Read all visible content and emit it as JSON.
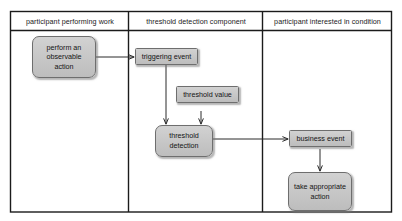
{
  "diagram": {
    "colors": {
      "node_fill": "#c6c6c6",
      "node_border": "#6e6e6e",
      "frame_line": "#1b1b1b",
      "connector": "#2b2b2b",
      "background": "#ffffff"
    },
    "lanes": [
      {
        "id": "lane-participant-performing-work",
        "label": "participant performing work"
      },
      {
        "id": "lane-threshold-detection-component",
        "label": "threshold detection component"
      },
      {
        "id": "lane-participant-interested-in-condition",
        "label": "participant interested in condition"
      }
    ],
    "nodes": [
      {
        "id": "node-perform-observable-action",
        "label": "perform an observable action",
        "shape": "rounded",
        "lane": 0
      },
      {
        "id": "node-triggering-event",
        "label": "triggering event",
        "shape": "sharp",
        "lane": 1
      },
      {
        "id": "node-threshold-value",
        "label": "threshold value",
        "shape": "sharp",
        "lane": 1
      },
      {
        "id": "node-threshold-detection",
        "label": "threshold detection",
        "shape": "rounded",
        "lane": 1
      },
      {
        "id": "node-business-event",
        "label": "business event",
        "shape": "sharp",
        "lane": 2
      },
      {
        "id": "node-take-appropriate-action",
        "label": "take appropriate action",
        "shape": "rounded",
        "lane": 2
      }
    ],
    "connectors": [
      {
        "id": "connector-action-to-triggering-event",
        "from": "node-perform-observable-action",
        "to": "node-triggering-event"
      },
      {
        "id": "connector-triggering-event-to-detection",
        "from": "node-triggering-event",
        "to": "node-threshold-detection"
      },
      {
        "id": "connector-threshold-value-to-detection",
        "from": "node-threshold-value",
        "to": "node-threshold-detection"
      },
      {
        "id": "connector-detection-to-business-event",
        "from": "node-threshold-detection",
        "to": "node-business-event"
      },
      {
        "id": "connector-business-event-to-take-action",
        "from": "node-business-event",
        "to": "node-take-appropriate-action"
      }
    ]
  }
}
